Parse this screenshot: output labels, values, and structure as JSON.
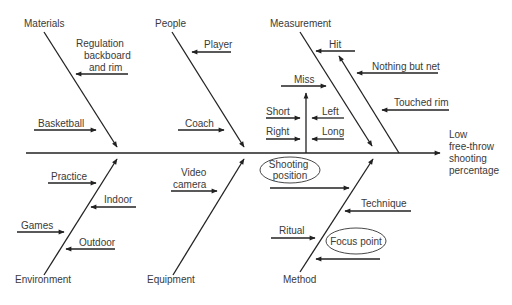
{
  "effect": {
    "lines": [
      "Low",
      "free-throw",
      "shooting",
      "percentage"
    ]
  },
  "categories": {
    "materials": "Materials",
    "people": "People",
    "measurement": "Measurement",
    "environment": "Environment",
    "equipment": "Equipment",
    "method": "Method"
  },
  "causes": {
    "materials": {
      "regulation": [
        "Regulation",
        "backboard",
        "and rim"
      ],
      "basketball": "Basketball"
    },
    "people": {
      "player": "Player",
      "coach": "Coach"
    },
    "measurement": {
      "hit": "Hit",
      "nothing_but_net": "Nothing but net",
      "touched_rim": "Touched rim",
      "miss": "Miss",
      "short": "Short",
      "left": "Left",
      "right": "Right",
      "long": "Long"
    },
    "environment": {
      "practice": "Practice",
      "indoor": "Indoor",
      "games": "Games",
      "outdoor": "Outdoor"
    },
    "equipment": {
      "video_camera": [
        "Video",
        "camera"
      ]
    },
    "method": {
      "shooting_position": [
        "Shooting",
        "position"
      ],
      "technique": "Technique",
      "ritual": "Ritual",
      "focus_point": "Focus point"
    }
  }
}
